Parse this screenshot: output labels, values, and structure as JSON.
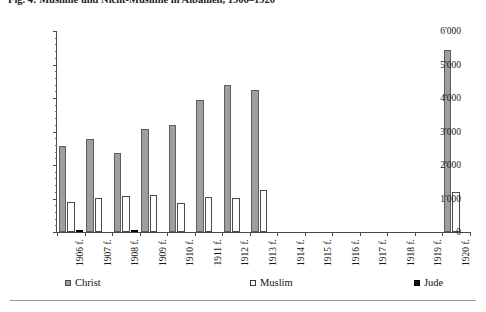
{
  "figure": {
    "title": "Fig. 4: Muslime und Nicht-Muslime in Albanien, 1906–1920",
    "y_axis_labels": [
      "0",
      "1'000",
      "2'000",
      "3'000",
      "4'000",
      "5'000",
      "6'000"
    ]
  },
  "legend": {
    "position": "bottom",
    "items": [
      {
        "label": "Christ",
        "marker": "filled-gray-square",
        "color": "#9e9e9e"
      },
      {
        "label": "Muslim",
        "marker": "hollow-square",
        "color": "#ffffff"
      },
      {
        "label": "Jude",
        "marker": "filled-black-square",
        "color": "#111111"
      }
    ]
  },
  "chart_data": {
    "type": "bar",
    "title": "Fig. 4: Muslime und Nicht-Muslime in Albanien, 1906–1920",
    "xlabel": "",
    "ylabel": "",
    "ylim": [
      0,
      6000
    ],
    "ytick_step": 1000,
    "grid": false,
    "legend_position": "bottom",
    "categories": [
      "1906 f.",
      "1907 f.",
      "1908 f.",
      "1909 f.",
      "1910 f.",
      "1911 f.",
      "1912 f.",
      "1913 f.",
      "1914 f.",
      "1915 f.",
      "1916 f.",
      "1917 f.",
      "1918 f.",
      "1919 f.",
      "1920 f."
    ],
    "series": [
      {
        "name": "Christ",
        "color": "#9e9e9e",
        "values": [
          2570,
          2790,
          2370,
          3080,
          3200,
          3930,
          4400,
          4230,
          0,
          0,
          0,
          0,
          0,
          0,
          5430
        ]
      },
      {
        "name": "Muslim",
        "color": "#ffffff",
        "values": [
          900,
          1020,
          1090,
          1100,
          880,
          1040,
          1020,
          1250,
          0,
          0,
          0,
          0,
          0,
          0,
          1180
        ]
      },
      {
        "name": "Jude",
        "color": "#111111",
        "values": [
          30,
          0,
          70,
          0,
          0,
          0,
          0,
          0,
          0,
          0,
          0,
          0,
          0,
          0,
          0
        ]
      }
    ]
  }
}
